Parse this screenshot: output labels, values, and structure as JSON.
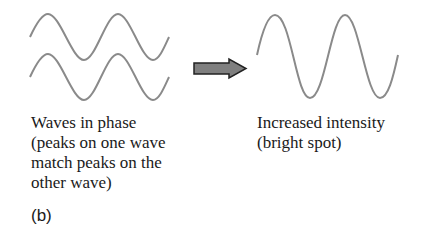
{
  "left": {
    "caption_lines": [
      "Waves in phase",
      "(peaks on one wave",
      "match peaks on the",
      "other wave)"
    ]
  },
  "right": {
    "caption_lines": [
      "Increased intensity",
      "(bright spot)"
    ]
  },
  "panel_label": "(b)",
  "colors": {
    "wave": "#8a8a8a",
    "arrow_fill": "#7f7f7f",
    "arrow_stroke": "#222222",
    "text": "#1a1a1a"
  },
  "icons": {
    "arrow": "right-arrow"
  }
}
